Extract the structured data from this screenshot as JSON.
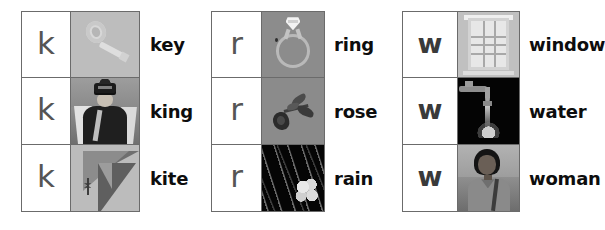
{
  "page": {
    "background_color": "#ffffff",
    "grid_border_color": "#6b6b6b",
    "letter_color": "#555555",
    "label_color": "#0d0d0d"
  },
  "groups": [
    {
      "id": "group-k",
      "letter": "k",
      "rows": [
        {
          "letter": "k",
          "label": "key",
          "picture": "key-photo",
          "picture_background": "#bdbdbd"
        },
        {
          "letter": "k",
          "label": "king",
          "picture": "king-photo",
          "picture_background": "#8e8e8e"
        },
        {
          "letter": "k",
          "label": "kite",
          "picture": "kite-photo",
          "picture_background": "#bcbcbc"
        }
      ]
    },
    {
      "id": "group-r",
      "letter": "r",
      "rows": [
        {
          "letter": "r",
          "label": "ring",
          "picture": "ring-photo",
          "picture_background": "#8c8c8c"
        },
        {
          "letter": "r",
          "label": "rose",
          "picture": "rose-photo",
          "picture_background": "#8b8b8b"
        },
        {
          "letter": "r",
          "label": "rain",
          "picture": "rain-photo",
          "picture_background": "#050505"
        }
      ]
    },
    {
      "id": "group-w",
      "letter": "w",
      "rows": [
        {
          "letter": "w",
          "label": "window",
          "picture": "window-photo",
          "picture_background": "#c0c0c0"
        },
        {
          "letter": "w",
          "label": "water",
          "picture": "water-photo",
          "picture_background": "#040404"
        },
        {
          "letter": "w",
          "label": "woman",
          "picture": "woman-photo",
          "picture_background": "#9e9e9e"
        }
      ]
    }
  ]
}
